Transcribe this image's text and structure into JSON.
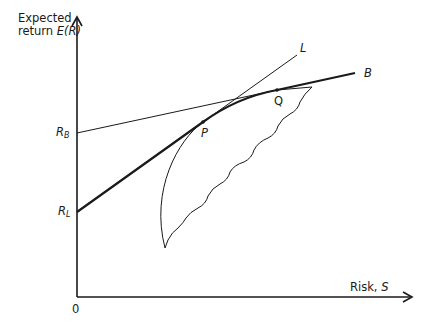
{
  "diagram": {
    "type": "efficient-frontier-with-borrowing-lending",
    "y_axis": {
      "label_line1": "Expected",
      "label_line2_prefix": "return ",
      "label_line2_var": "E(R)"
    },
    "x_axis": {
      "label_prefix": "Risk, ",
      "label_var": "S",
      "origin": "0"
    },
    "intercepts": {
      "r_b": {
        "base": "R",
        "sub": "B"
      },
      "r_l": {
        "base": "R",
        "sub": "L"
      }
    },
    "lines": {
      "lending_line": "L",
      "borrowing_line": "B"
    },
    "points": {
      "tangency_lending": "P",
      "tangency_borrowing": "Q"
    },
    "colors": {
      "ink": "#1a1a1a",
      "background": "#ffffff"
    }
  }
}
